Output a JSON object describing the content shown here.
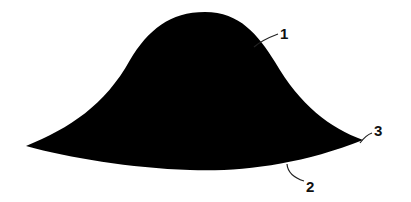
{
  "figure": {
    "shape_color": "#000000",
    "background": "#ffffff",
    "labels": [
      {
        "id": "1",
        "text": "1",
        "target": "upper curved surface"
      },
      {
        "id": "2",
        "text": "2",
        "target": "lower concave edge"
      },
      {
        "id": "3",
        "text": "3",
        "target": "right tip"
      }
    ]
  }
}
